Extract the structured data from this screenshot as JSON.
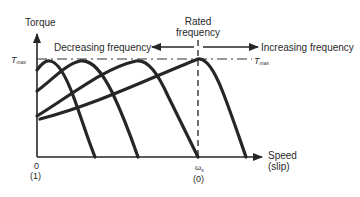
{
  "diagram": {
    "y_axis": {
      "label": "Torque"
    },
    "x_axis": {
      "label_line1": "Speed",
      "label_line2": "(slip)"
    },
    "origin": {
      "speed_label": "0",
      "slip_label": "(1)"
    },
    "synchronous": {
      "speed_label": "ω",
      "speed_subscript": "s",
      "slip_label": "(0)"
    },
    "tmax": {
      "left_label": "T",
      "left_subscript": "max",
      "right_label": "T",
      "right_subscript": "max"
    },
    "rated_frequency": {
      "line1": "Rated",
      "line2": "frequency"
    },
    "decreasing": {
      "label": "Decreasing frequency"
    },
    "increasing": {
      "label": "Increasing frequency"
    },
    "curves": [
      {
        "name": "lowest-frequency",
        "peak_x": 50,
        "zero_x": 95
      },
      {
        "name": "low-frequency",
        "peak_x": 80,
        "zero_x": 138
      },
      {
        "name": "mid-frequency",
        "peak_x": 136,
        "zero_x": 198
      },
      {
        "name": "rated-frequency",
        "peak_x": 198,
        "zero_x": 246
      }
    ]
  }
}
